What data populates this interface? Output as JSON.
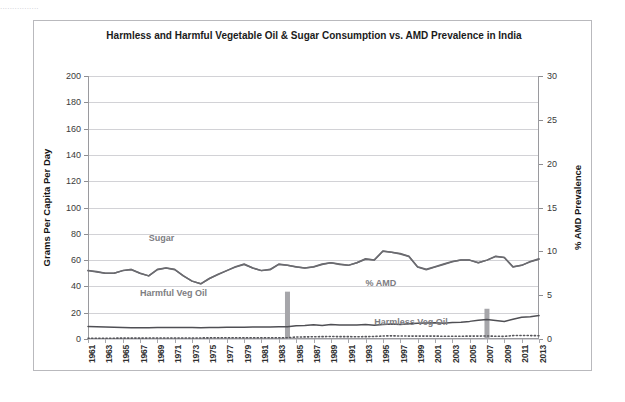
{
  "top_strip": "................",
  "chart_data": {
    "type": "line",
    "title": "Harmless and Harmful Vegetable Oil & Sugar Consumption vs. AMD Prevalence in India",
    "xlabel": "",
    "ylabel": "Grams Per Capita Per Day",
    "y2label": "% AMD Prevalence",
    "ylim": [
      0,
      200
    ],
    "y2lim": [
      0,
      30
    ],
    "yticks": [
      0,
      20,
      40,
      60,
      80,
      100,
      120,
      140,
      160,
      180,
      200
    ],
    "y2ticks": [
      0,
      5,
      10,
      15,
      20,
      25,
      30
    ],
    "grid": true,
    "legend_position": "inline-annotations",
    "x_start": 1961,
    "x_end": 2013,
    "xtick_labels": [
      "1961",
      "1963",
      "1965",
      "1967",
      "1969",
      "1971",
      "1973",
      "1975",
      "1977",
      "1979",
      "1981",
      "1983",
      "1985",
      "1987",
      "1989",
      "1991",
      "1993",
      "1995",
      "1997",
      "1999",
      "2001",
      "2003",
      "2005",
      "2007",
      "2009",
      "2011",
      "2013"
    ],
    "annotations": [
      {
        "text": "Sugar",
        "x": 1968,
        "y": 76
      },
      {
        "text": "Harmful Veg Oil",
        "x": 1967,
        "y": 34
      },
      {
        "text": "% AMD",
        "x": 1993,
        "y": 42
      },
      {
        "text": "Harmless Veg Oil",
        "x": 1994,
        "y": 12
      }
    ],
    "series": [
      {
        "name": "Sugar",
        "axis": "left",
        "color": "#6b6b70",
        "style": "solid",
        "x": [
          1961,
          1962,
          1963,
          1964,
          1965,
          1966,
          1967,
          1968,
          1969,
          1970,
          1971,
          1972,
          1973,
          1974,
          1975,
          1976,
          1977,
          1978,
          1979,
          1980,
          1981,
          1982,
          1983,
          1984,
          1985,
          1986,
          1987,
          1988,
          1989,
          1990,
          1991,
          1992,
          1993,
          1994,
          1995,
          1996,
          1997,
          1998,
          1999,
          2000,
          2001,
          2002,
          2003,
          2004,
          2005,
          2006,
          2007,
          2008,
          2009,
          2010,
          2011,
          2012,
          2013
        ],
        "values": [
          52,
          51,
          50,
          50,
          52,
          53,
          50,
          48,
          53,
          54,
          53,
          48,
          44,
          42,
          46,
          49,
          52,
          55,
          57,
          54,
          52,
          53,
          57,
          56,
          55,
          54,
          55,
          57,
          58,
          57,
          56,
          58,
          61,
          60,
          67,
          66,
          65,
          63,
          55,
          53,
          55,
          57,
          59,
          60,
          60,
          58,
          60,
          63,
          62,
          55,
          56,
          59,
          61
        ]
      },
      {
        "name": "% AMD",
        "axis": "right",
        "color": "#6b6b70",
        "style": "solid",
        "x": [
          1961,
          1962,
          1963,
          1964,
          1965,
          1966,
          1967,
          1968,
          1969,
          1970,
          1971,
          1972,
          1973,
          1974,
          1975,
          1976,
          1977,
          1978,
          1979,
          1980,
          1981,
          1982,
          1983,
          1984,
          1985,
          1986,
          1987,
          1988,
          1989,
          1990,
          1991,
          1992,
          1993,
          1994,
          1995,
          1996,
          1997,
          1998,
          1999,
          2000,
          2001,
          2002,
          2003,
          2004,
          2005,
          2006,
          2007,
          2008,
          2009,
          2010,
          2011,
          2012,
          2013
        ],
        "values": [
          7.8,
          7.7,
          7.5,
          7.5,
          7.8,
          7.9,
          7.5,
          7.2,
          7.9,
          8.1,
          7.9,
          7.2,
          6.6,
          6.3,
          6.9,
          7.4,
          7.8,
          8.2,
          8.5,
          8.1,
          7.8,
          7.9,
          8.5,
          8.4,
          8.2,
          8.1,
          8.2,
          8.5,
          8.7,
          8.5,
          8.4,
          8.7,
          9.1,
          9.0,
          10.0,
          9.9,
          9.7,
          9.4,
          8.2,
          7.9,
          8.2,
          8.5,
          8.8,
          9.0,
          9.0,
          8.7,
          9.0,
          9.4,
          9.3,
          8.2,
          8.4,
          8.8,
          9.1
        ]
      },
      {
        "name": "Harmful Veg Oil",
        "axis": "left",
        "color": "#4f4f54",
        "style": "solid",
        "x": [
          1961,
          1962,
          1963,
          1964,
          1965,
          1966,
          1967,
          1968,
          1969,
          1970,
          1971,
          1972,
          1973,
          1974,
          1975,
          1976,
          1977,
          1978,
          1979,
          1980,
          1981,
          1982,
          1983,
          1984,
          1985,
          1986,
          1987,
          1988,
          1989,
          1990,
          1991,
          1992,
          1993,
          1994,
          1995,
          1996,
          1997,
          1998,
          1999,
          2000,
          2001,
          2002,
          2003,
          2004,
          2005,
          2006,
          2007,
          2008,
          2009,
          2010,
          2011,
          2012,
          2013
        ],
        "values": [
          9.5,
          9.4,
          9.2,
          9.0,
          8.8,
          8.6,
          8.5,
          8.6,
          8.7,
          8.7,
          8.8,
          8.8,
          8.7,
          8.6,
          8.7,
          8.8,
          8.9,
          9.0,
          9.0,
          9.1,
          9.1,
          9.2,
          9.3,
          9.4,
          10.0,
          10.2,
          10.8,
          10.3,
          11.0,
          10.6,
          10.6,
          10.7,
          11.0,
          10.4,
          11.0,
          11.4,
          11.1,
          11.6,
          12.0,
          12.2,
          12.4,
          12.0,
          12.5,
          12.8,
          13.4,
          14.2,
          14.8,
          14.0,
          13.3,
          15.0,
          16.6,
          17.0,
          17.8
        ]
      },
      {
        "name": "Harmless Veg Oil",
        "axis": "left",
        "color": "#56565b",
        "style": "dotted",
        "x": [
          1961,
          1962,
          1963,
          1964,
          1965,
          1966,
          1967,
          1968,
          1969,
          1970,
          1971,
          1972,
          1973,
          1974,
          1975,
          1976,
          1977,
          1978,
          1979,
          1980,
          1981,
          1982,
          1983,
          1984,
          1985,
          1986,
          1987,
          1988,
          1989,
          1990,
          1991,
          1992,
          1993,
          1994,
          1995,
          1996,
          1997,
          1998,
          1999,
          2000,
          2001,
          2002,
          2003,
          2004,
          2005,
          2006,
          2007,
          2008,
          2009,
          2010,
          2011,
          2012,
          2013
        ],
        "values": [
          0.6,
          0.6,
          0.6,
          0.6,
          0.7,
          0.7,
          0.7,
          0.7,
          0.8,
          0.8,
          0.8,
          0.8,
          0.8,
          0.8,
          0.9,
          0.9,
          0.9,
          0.9,
          1.0,
          1.0,
          1.0,
          1.0,
          1.0,
          1.0,
          1.5,
          1.6,
          1.7,
          1.8,
          1.9,
          1.8,
          1.8,
          1.7,
          1.8,
          1.9,
          2.3,
          2.4,
          2.3,
          2.2,
          2.2,
          2.2,
          2.2,
          2.1,
          2.1,
          2.1,
          2.2,
          2.2,
          2.3,
          2.1,
          2.0,
          2.6,
          2.7,
          2.6,
          2.5
        ]
      }
    ],
    "bars": [
      {
        "name": "event-bar-1984",
        "x": 1984,
        "top_value": 36,
        "bottom_value": 0,
        "color": "#a6a6aa"
      },
      {
        "name": "event-bar-2007",
        "x": 2007,
        "top_value": 23,
        "bottom_value": 0,
        "color": "#a6a6aa"
      }
    ]
  }
}
